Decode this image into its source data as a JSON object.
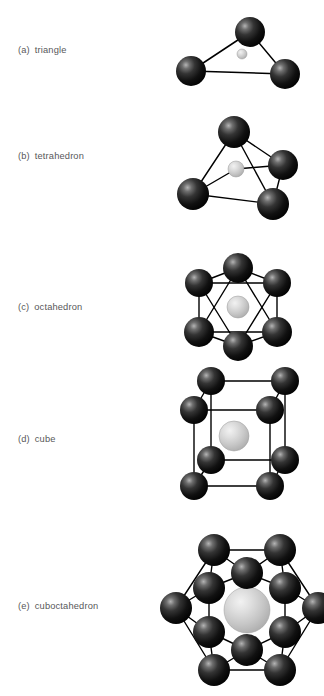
{
  "figure": {
    "background_color": "#ffffff",
    "vertex_sphere_color": "#1a1a1a",
    "center_sphere_color": "#c9c9c9",
    "edge_color": "#000000",
    "label_color": "#58585a"
  },
  "panels": [
    {
      "tag": "(a)",
      "name": "triangle",
      "vertex_count": 3,
      "center_atom": true,
      "label_x": 18,
      "label_y": 46,
      "diagram": {
        "x": 172,
        "y": 8,
        "width": 140,
        "height": 96
      },
      "vertices": [
        {
          "cx": 78,
          "cy": 24,
          "r": 15
        },
        {
          "cx": 19,
          "cy": 63,
          "r": 15
        },
        {
          "cx": 113,
          "cy": 66,
          "r": 15
        }
      ],
      "center": {
        "cx": 70,
        "cy": 46,
        "r": 5
      },
      "edges": [
        [
          78,
          24,
          19,
          63
        ],
        [
          78,
          24,
          113,
          66
        ],
        [
          19,
          63,
          113,
          66
        ]
      ]
    },
    {
      "tag": "(b)",
      "name": "tetrahedron",
      "vertex_count": 4,
      "center_atom": true,
      "label_x": 18,
      "label_y": 152,
      "diagram": {
        "x": 172,
        "y": 116,
        "width": 140,
        "height": 104
      },
      "vertices": [
        {
          "cx": 62,
          "cy": 16,
          "r": 16
        },
        {
          "cx": 111,
          "cy": 49,
          "r": 15
        },
        {
          "cx": 21,
          "cy": 78,
          "r": 16
        },
        {
          "cx": 101,
          "cy": 88,
          "r": 16
        }
      ],
      "center": {
        "cx": 64,
        "cy": 53,
        "r": 8
      },
      "edges": [
        [
          62,
          16,
          21,
          78
        ],
        [
          62,
          16,
          111,
          49
        ],
        [
          62,
          16,
          101,
          88
        ],
        [
          111,
          49,
          101,
          88
        ],
        [
          21,
          78,
          101,
          88
        ],
        [
          21,
          78,
          64,
          53
        ],
        [
          111,
          49,
          64,
          53
        ]
      ]
    },
    {
      "tag": "(c)",
      "name": "octahedron",
      "vertex_count": 6,
      "center_atom": true,
      "label_x": 18,
      "label_y": 303,
      "diagram": {
        "x": 172,
        "y": 256,
        "width": 140,
        "height": 110
      },
      "vertices": [
        {
          "cx": 66,
          "cy": 12,
          "r": 15
        },
        {
          "cx": 27,
          "cy": 27,
          "r": 14
        },
        {
          "cx": 105,
          "cy": 27,
          "r": 14
        },
        {
          "cx": 27,
          "cy": 76,
          "r": 15
        },
        {
          "cx": 105,
          "cy": 76,
          "r": 15
        },
        {
          "cx": 66,
          "cy": 90,
          "r": 15
        }
      ],
      "center": {
        "cx": 66,
        "cy": 51,
        "r": 11
      },
      "edges": [
        [
          66,
          12,
          27,
          27
        ],
        [
          66,
          12,
          105,
          27
        ],
        [
          27,
          27,
          27,
          76
        ],
        [
          105,
          27,
          105,
          76
        ],
        [
          27,
          76,
          66,
          90
        ],
        [
          105,
          76,
          66,
          90
        ],
        [
          66,
          12,
          27,
          76
        ],
        [
          66,
          12,
          105,
          76
        ],
        [
          27,
          27,
          66,
          90
        ],
        [
          105,
          27,
          66,
          90
        ],
        [
          27,
          27,
          105,
          27
        ],
        [
          27,
          76,
          105,
          76
        ]
      ]
    },
    {
      "tag": "(d)",
      "name": "cube",
      "vertex_count": 8,
      "center_atom": true,
      "label_x": 18,
      "label_y": 435,
      "diagram": {
        "x": 172,
        "y": 366,
        "width": 140,
        "height": 128
      },
      "vertices": [
        {
          "cx": 39,
          "cy": 15,
          "r": 14
        },
        {
          "cx": 113,
          "cy": 15,
          "r": 14
        },
        {
          "cx": 22,
          "cy": 44,
          "r": 14
        },
        {
          "cx": 98,
          "cy": 44,
          "r": 14
        },
        {
          "cx": 39,
          "cy": 94,
          "r": 14
        },
        {
          "cx": 113,
          "cy": 94,
          "r": 14
        },
        {
          "cx": 22,
          "cy": 120,
          "r": 14
        },
        {
          "cx": 98,
          "cy": 120,
          "r": 14
        }
      ],
      "center": {
        "cx": 62,
        "cy": 70,
        "r": 15
      },
      "edges": [
        [
          39,
          15,
          113,
          15
        ],
        [
          39,
          15,
          22,
          44
        ],
        [
          113,
          15,
          98,
          44
        ],
        [
          22,
          44,
          98,
          44
        ],
        [
          39,
          15,
          39,
          94
        ],
        [
          113,
          15,
          113,
          94
        ],
        [
          22,
          44,
          22,
          120
        ],
        [
          98,
          44,
          98,
          120
        ],
        [
          39,
          94,
          113,
          94
        ],
        [
          39,
          94,
          22,
          120
        ],
        [
          113,
          94,
          98,
          120
        ],
        [
          22,
          120,
          98,
          120
        ]
      ]
    },
    {
      "tag": "(e)",
      "name": "cuboctahedron",
      "vertex_count": 12,
      "center_atom": true,
      "label_x": 18,
      "label_y": 602,
      "diagram": {
        "x": 162,
        "y": 528,
        "width": 156,
        "height": 164
      },
      "vertices": [
        {
          "cx": 52,
          "cy": 22,
          "r": 16
        },
        {
          "cx": 118,
          "cy": 22,
          "r": 16
        },
        {
          "cx": 85,
          "cy": 45,
          "r": 16
        },
        {
          "cx": 47,
          "cy": 60,
          "r": 16
        },
        {
          "cx": 123,
          "cy": 60,
          "r": 16
        },
        {
          "cx": 14,
          "cy": 80,
          "r": 16
        },
        {
          "cx": 156,
          "cy": 80,
          "r": 16
        },
        {
          "cx": 47,
          "cy": 104,
          "r": 16
        },
        {
          "cx": 123,
          "cy": 104,
          "r": 16
        },
        {
          "cx": 85,
          "cy": 122,
          "r": 16
        },
        {
          "cx": 52,
          "cy": 142,
          "r": 16
        },
        {
          "cx": 118,
          "cy": 142,
          "r": 16
        }
      ],
      "center": {
        "cx": 85,
        "cy": 82,
        "r": 23
      },
      "edges": [
        [
          52,
          22,
          118,
          22
        ],
        [
          52,
          22,
          14,
          80
        ],
        [
          118,
          22,
          156,
          80
        ],
        [
          14,
          80,
          52,
          142
        ],
        [
          156,
          80,
          118,
          142
        ],
        [
          52,
          142,
          118,
          142
        ],
        [
          52,
          22,
          85,
          45
        ],
        [
          118,
          22,
          85,
          45
        ],
        [
          52,
          22,
          47,
          60
        ],
        [
          118,
          22,
          123,
          60
        ],
        [
          85,
          45,
          47,
          60
        ],
        [
          85,
          45,
          123,
          60
        ],
        [
          14,
          80,
          47,
          60
        ],
        [
          156,
          80,
          123,
          60
        ],
        [
          14,
          80,
          47,
          104
        ],
        [
          156,
          80,
          123,
          104
        ],
        [
          47,
          60,
          47,
          104
        ],
        [
          123,
          60,
          123,
          104
        ],
        [
          47,
          104,
          85,
          122
        ],
        [
          123,
          104,
          85,
          122
        ],
        [
          52,
          142,
          47,
          104
        ],
        [
          118,
          142,
          123,
          104
        ],
        [
          52,
          142,
          85,
          122
        ],
        [
          118,
          142,
          85,
          122
        ]
      ]
    }
  ]
}
